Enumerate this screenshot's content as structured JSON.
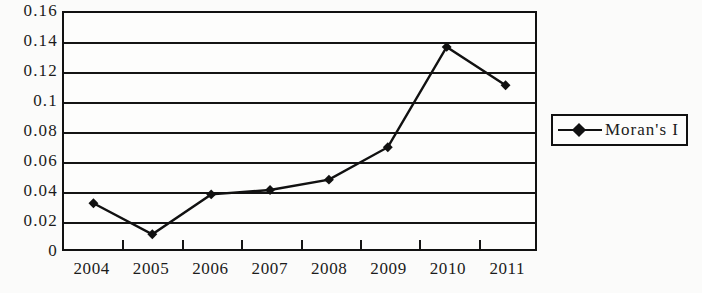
{
  "chart_data": {
    "type": "line",
    "title": "",
    "xlabel": "",
    "ylabel": "",
    "categories": [
      "2004",
      "2005",
      "2006",
      "2007",
      "2008",
      "2009",
      "2010",
      "2011"
    ],
    "series": [
      {
        "name": "Moran's I",
        "values": [
          0.031,
          0.01,
          0.037,
          0.04,
          0.047,
          0.069,
          0.137,
          0.111
        ]
      }
    ],
    "ylim": [
      0,
      0.16
    ],
    "ytick_labels": [
      "0.16",
      "0.14",
      "0.12",
      "0.1",
      "0.08",
      "0.06",
      "0.04",
      "0.02",
      "0"
    ],
    "ytick_values": [
      0.16,
      0.14,
      0.12,
      0.1,
      0.08,
      0.06,
      0.04,
      0.02,
      0
    ],
    "grid": true,
    "legend_position": "right",
    "marker": "diamond",
    "line_color": "#111111",
    "marker_color": "#111111"
  },
  "legend": {
    "entries": [
      {
        "label": "Moran's I",
        "symbol": "line-diamond-marker"
      }
    ]
  }
}
